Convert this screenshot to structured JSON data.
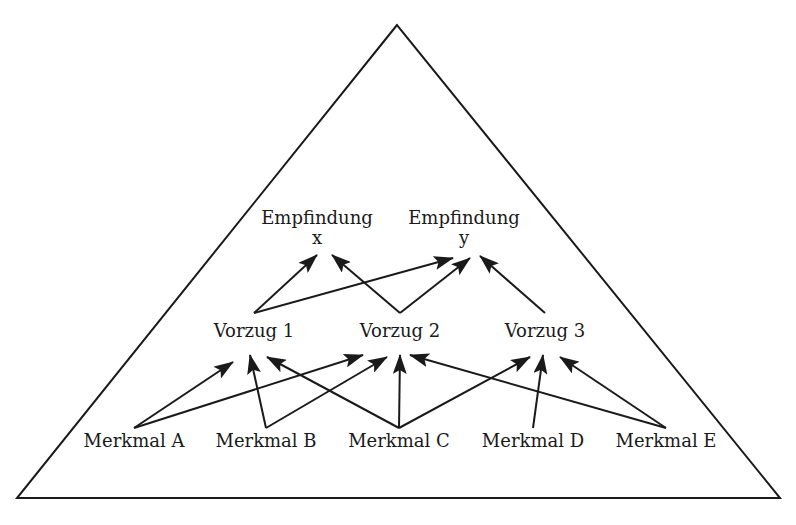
{
  "diagram": {
    "type": "hierarchy-triangle",
    "colors": {
      "line": "#1a1a1a",
      "background": "#ffffff"
    },
    "triangle": {
      "apex": [
        397,
        25
      ],
      "bottom_left": [
        17,
        498
      ],
      "bottom_right": [
        780,
        498
      ]
    },
    "levels": {
      "empfindungen": [
        {
          "id": "ex",
          "label": "Empfindung",
          "sublabel": "x",
          "pos": [
            317,
            222
          ]
        },
        {
          "id": "ey",
          "label": "Empfindung",
          "sublabel": "y",
          "pos": [
            464,
            222
          ]
        }
      ],
      "vorzuege": [
        {
          "id": "v1",
          "label": "Vorzug 1",
          "pos": [
            254,
            335
          ]
        },
        {
          "id": "v2",
          "label": "Vorzug 2",
          "pos": [
            400,
            335
          ]
        },
        {
          "id": "v3",
          "label": "Vorzug 3",
          "pos": [
            545,
            335
          ]
        }
      ],
      "merkmale": [
        {
          "id": "ma",
          "label": "Merkmal A",
          "pos": [
            134,
            445
          ]
        },
        {
          "id": "mb",
          "label": "Merkmal B",
          "pos": [
            266,
            445
          ]
        },
        {
          "id": "mc",
          "label": "Merkmal C",
          "pos": [
            399,
            445
          ]
        },
        {
          "id": "md",
          "label": "Merkmal D",
          "pos": [
            533,
            445
          ]
        },
        {
          "id": "me",
          "label": "Merkmal E",
          "pos": [
            666,
            445
          ]
        }
      ]
    },
    "edges": [
      {
        "from": "v1",
        "to": "ex",
        "x1": 254,
        "y1": 313,
        "x2": 317,
        "y2": 255
      },
      {
        "from": "v1",
        "to": "ey",
        "x1": 254,
        "y1": 313,
        "x2": 453,
        "y2": 258
      },
      {
        "from": "v2",
        "to": "ex",
        "x1": 400,
        "y1": 313,
        "x2": 332,
        "y2": 255
      },
      {
        "from": "v2",
        "to": "ey",
        "x1": 400,
        "y1": 313,
        "x2": 470,
        "y2": 258
      },
      {
        "from": "v3",
        "to": "ey",
        "x1": 545,
        "y1": 313,
        "x2": 480,
        "y2": 256
      },
      {
        "from": "ma",
        "to": "v1",
        "x1": 134,
        "y1": 428,
        "x2": 233,
        "y2": 362
      },
      {
        "from": "ma",
        "to": "v2",
        "x1": 134,
        "y1": 428,
        "x2": 363,
        "y2": 355
      },
      {
        "from": "mb",
        "to": "v1",
        "x1": 266,
        "y1": 428,
        "x2": 250,
        "y2": 355
      },
      {
        "from": "mb",
        "to": "v2",
        "x1": 266,
        "y1": 428,
        "x2": 387,
        "y2": 357
      },
      {
        "from": "mc",
        "to": "v1",
        "x1": 399,
        "y1": 428,
        "x2": 267,
        "y2": 357
      },
      {
        "from": "mc",
        "to": "v2",
        "x1": 399,
        "y1": 428,
        "x2": 400,
        "y2": 355
      },
      {
        "from": "mc",
        "to": "v3",
        "x1": 399,
        "y1": 428,
        "x2": 530,
        "y2": 357
      },
      {
        "from": "md",
        "to": "v3",
        "x1": 533,
        "y1": 428,
        "x2": 543,
        "y2": 355
      },
      {
        "from": "me",
        "to": "v2",
        "x1": 666,
        "y1": 428,
        "x2": 410,
        "y2": 355
      },
      {
        "from": "me",
        "to": "v3",
        "x1": 666,
        "y1": 428,
        "x2": 560,
        "y2": 357
      }
    ]
  }
}
